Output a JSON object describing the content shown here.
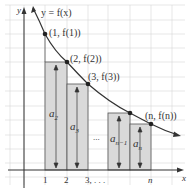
{
  "diagram": {
    "curve_label": "y = f(x)",
    "axes": {
      "x_label": "x",
      "y_label": "y"
    },
    "points": [
      {
        "label": "(1, f(1))",
        "x": 45,
        "y": 34
      },
      {
        "label": "(2, f(2))",
        "x": 67,
        "y": 62
      },
      {
        "label": "(3, f(3))",
        "x": 88,
        "y": 84
      },
      {
        "label": "(n, f(n))",
        "x": 151,
        "y": 124
      }
    ],
    "rectangles": [
      {
        "label_main": "a",
        "label_sub": "2",
        "x1": 45,
        "x2": 67,
        "top": 62
      },
      {
        "label_main": "a",
        "label_sub": "3",
        "x1": 67,
        "x2": 88,
        "top": 84
      },
      {
        "label_main": "a",
        "label_sub": "n−1",
        "x1": 108,
        "x2": 130,
        "top": 113
      },
      {
        "label_main": "a",
        "label_sub": "n",
        "x1": 130,
        "x2": 151,
        "top": 124
      }
    ],
    "ellipsis": "...",
    "x_ticks": [
      "1",
      "2",
      "3, . . .",
      "n"
    ],
    "colors": {
      "rect_fill": "#d9d9d9",
      "rect_stroke": "#555555",
      "curve": "#333333",
      "grid": "#d0d0d0",
      "axis": "#333333"
    }
  }
}
